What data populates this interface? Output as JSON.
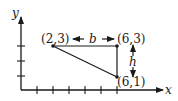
{
  "diagram": {
    "type": "coordinate-plane-right-triangle",
    "axes": {
      "x_label": "x",
      "y_label": "y",
      "x_ticks": 6,
      "y_ticks": 3
    },
    "points": [
      {
        "label": "(2,3)",
        "x": 2,
        "y": 3
      },
      {
        "label": "(6,3)",
        "x": 6,
        "y": 3
      },
      {
        "label": "(6,1)",
        "x": 6,
        "y": 1
      }
    ],
    "base_label": "b",
    "height_label": "h",
    "colors": {
      "ink": "#1a1a1a",
      "background": "#ffffff"
    }
  }
}
